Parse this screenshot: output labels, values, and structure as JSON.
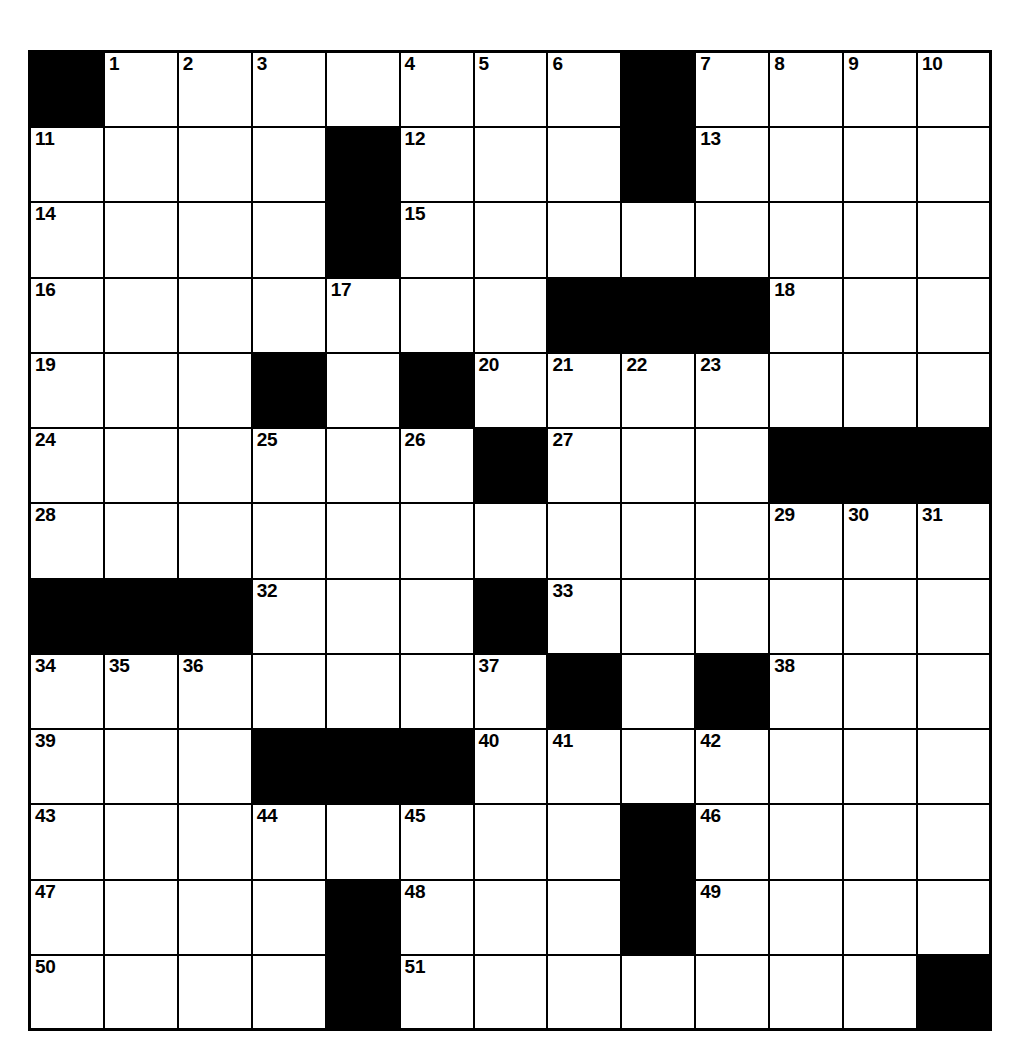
{
  "puzzle": {
    "title": "Crossword Grid",
    "type": "crossword",
    "rows": 13,
    "columns": 13,
    "colors": {
      "block": "#000000",
      "open": "#ffffff",
      "border": "#000000",
      "number_text": "#000000"
    },
    "total_clue_numbers": 51,
    "grid": [
      [
        "#",
        "1",
        "2",
        "3",
        "",
        "4",
        "5",
        "6",
        "#",
        "7",
        "8",
        "9",
        "10"
      ],
      [
        "11",
        "",
        "",
        "",
        "#",
        "12",
        "",
        "",
        "#",
        "13",
        "",
        "",
        ""
      ],
      [
        "14",
        "",
        "",
        "",
        "#",
        "15",
        "",
        "",
        "",
        "",
        "",
        "",
        ""
      ],
      [
        "16",
        "",
        "",
        "",
        "17",
        "",
        "",
        "#",
        "#",
        "#",
        "18",
        "",
        ""
      ],
      [
        "19",
        "",
        "",
        "#",
        "",
        "#",
        "20",
        "21",
        "22",
        "23",
        "",
        "",
        ""
      ],
      [
        "24",
        "",
        "",
        "25",
        "",
        "26",
        "#",
        "27",
        "",
        "",
        "#",
        "#",
        "#"
      ],
      [
        "28",
        "",
        "",
        "",
        "",
        "",
        "",
        "",
        "",
        "",
        "29",
        "30",
        "31"
      ],
      [
        "#",
        "#",
        "#",
        "32",
        "",
        "",
        "#",
        "33",
        "",
        "",
        "",
        "",
        ""
      ],
      [
        "34",
        "35",
        "36",
        "",
        "",
        "",
        "37",
        "#",
        "",
        "#",
        "38",
        "",
        ""
      ],
      [
        "39",
        "",
        "",
        "#",
        "#",
        "#",
        "40",
        "41",
        "",
        "42",
        "",
        "",
        ""
      ],
      [
        "43",
        "",
        "",
        "44",
        "",
        "45",
        "",
        "",
        "#",
        "46",
        "",
        "",
        ""
      ],
      [
        "47",
        "",
        "",
        "",
        "#",
        "48",
        "",
        "",
        "#",
        "49",
        "",
        "",
        ""
      ],
      [
        "50",
        "",
        "",
        "",
        "#",
        "51",
        "",
        "",
        "",
        "",
        "",
        "",
        "#"
      ]
    ],
    "numbers": [
      {
        "n": "1",
        "row": 0,
        "col": 1
      },
      {
        "n": "2",
        "row": 0,
        "col": 2
      },
      {
        "n": "3",
        "row": 0,
        "col": 3
      },
      {
        "n": "4",
        "row": 0,
        "col": 5
      },
      {
        "n": "5",
        "row": 0,
        "col": 6
      },
      {
        "n": "6",
        "row": 0,
        "col": 7
      },
      {
        "n": "7",
        "row": 0,
        "col": 9
      },
      {
        "n": "8",
        "row": 0,
        "col": 10
      },
      {
        "n": "9",
        "row": 0,
        "col": 11
      },
      {
        "n": "10",
        "row": 0,
        "col": 12
      },
      {
        "n": "11",
        "row": 1,
        "col": 0
      },
      {
        "n": "12",
        "row": 1,
        "col": 5
      },
      {
        "n": "13",
        "row": 1,
        "col": 9
      },
      {
        "n": "14",
        "row": 2,
        "col": 0
      },
      {
        "n": "15",
        "row": 2,
        "col": 5
      },
      {
        "n": "16",
        "row": 3,
        "col": 0
      },
      {
        "n": "17",
        "row": 3,
        "col": 4
      },
      {
        "n": "18",
        "row": 3,
        "col": 10
      },
      {
        "n": "19",
        "row": 4,
        "col": 0
      },
      {
        "n": "20",
        "row": 4,
        "col": 6
      },
      {
        "n": "21",
        "row": 4,
        "col": 7
      },
      {
        "n": "22",
        "row": 4,
        "col": 8
      },
      {
        "n": "23",
        "row": 4,
        "col": 9
      },
      {
        "n": "24",
        "row": 5,
        "col": 0
      },
      {
        "n": "25",
        "row": 5,
        "col": 3
      },
      {
        "n": "26",
        "row": 5,
        "col": 5
      },
      {
        "n": "27",
        "row": 5,
        "col": 7
      },
      {
        "n": "28",
        "row": 6,
        "col": 0
      },
      {
        "n": "29",
        "row": 6,
        "col": 10
      },
      {
        "n": "30",
        "row": 6,
        "col": 11
      },
      {
        "n": "31",
        "row": 6,
        "col": 12
      },
      {
        "n": "32",
        "row": 7,
        "col": 3
      },
      {
        "n": "33",
        "row": 7,
        "col": 7
      },
      {
        "n": "34",
        "row": 8,
        "col": 0
      },
      {
        "n": "35",
        "row": 8,
        "col": 1
      },
      {
        "n": "36",
        "row": 8,
        "col": 2
      },
      {
        "n": "37",
        "row": 8,
        "col": 6
      },
      {
        "n": "38",
        "row": 8,
        "col": 10
      },
      {
        "n": "39",
        "row": 9,
        "col": 0
      },
      {
        "n": "40",
        "row": 9,
        "col": 6
      },
      {
        "n": "41",
        "row": 9,
        "col": 7
      },
      {
        "n": "42",
        "row": 9,
        "col": 9
      },
      {
        "n": "43",
        "row": 10,
        "col": 0
      },
      {
        "n": "44",
        "row": 10,
        "col": 3
      },
      {
        "n": "45",
        "row": 10,
        "col": 5
      },
      {
        "n": "46",
        "row": 10,
        "col": 9
      },
      {
        "n": "47",
        "row": 11,
        "col": 0
      },
      {
        "n": "48",
        "row": 11,
        "col": 5
      },
      {
        "n": "49",
        "row": 11,
        "col": 9
      },
      {
        "n": "50",
        "row": 12,
        "col": 0
      },
      {
        "n": "51",
        "row": 12,
        "col": 5
      }
    ],
    "blocks": [
      {
        "row": 0,
        "col": 0
      },
      {
        "row": 0,
        "col": 8
      },
      {
        "row": 1,
        "col": 4
      },
      {
        "row": 1,
        "col": 8
      },
      {
        "row": 2,
        "col": 4
      },
      {
        "row": 3,
        "col": 7
      },
      {
        "row": 3,
        "col": 8
      },
      {
        "row": 3,
        "col": 9
      },
      {
        "row": 4,
        "col": 3
      },
      {
        "row": 4,
        "col": 5
      },
      {
        "row": 5,
        "col": 6
      },
      {
        "row": 5,
        "col": 10
      },
      {
        "row": 5,
        "col": 11
      },
      {
        "row": 5,
        "col": 12
      },
      {
        "row": 7,
        "col": 0
      },
      {
        "row": 7,
        "col": 1
      },
      {
        "row": 7,
        "col": 2
      },
      {
        "row": 7,
        "col": 6
      },
      {
        "row": 8,
        "col": 7
      },
      {
        "row": 8,
        "col": 9
      },
      {
        "row": 9,
        "col": 3
      },
      {
        "row": 9,
        "col": 4
      },
      {
        "row": 9,
        "col": 5
      },
      {
        "row": 10,
        "col": 8
      },
      {
        "row": 11,
        "col": 4
      },
      {
        "row": 11,
        "col": 8
      },
      {
        "row": 12,
        "col": 4
      },
      {
        "row": 12,
        "col": 12
      }
    ]
  }
}
